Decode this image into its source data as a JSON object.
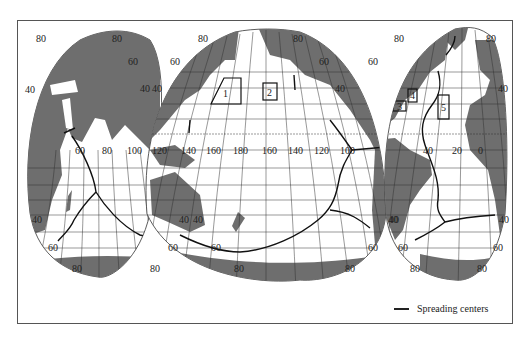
{
  "map": {
    "projection": "interrupted (three-lobe) world map",
    "colors": {
      "land": "#6e6e6e",
      "ocean": "#ffffff",
      "grid": "#333333",
      "ridge": "#111111",
      "frame": "#555555"
    },
    "lobes": [
      {
        "name": "Indian Ocean / Africa-Eurasia lobe",
        "lat_labels_top": [
          "80",
          "80",
          "60",
          "40",
          "40"
        ],
        "lat_labels_bottom": [
          "40",
          "40",
          "60",
          "60",
          "80",
          "80"
        ],
        "lon_labels": [
          "60",
          "80",
          "100",
          "120"
        ]
      },
      {
        "name": "Pacific lobe",
        "lat_labels_top": [
          "80",
          "80",
          "60",
          "60",
          "40",
          "40"
        ],
        "lat_labels_bottom": [
          "40",
          "40",
          "60",
          "60",
          "80",
          "80"
        ],
        "lon_labels": [
          "140",
          "160",
          "180",
          "160",
          "140",
          "120",
          "100"
        ]
      },
      {
        "name": "Atlantic lobe",
        "lat_labels_top": [
          "80",
          "80",
          "60",
          "40"
        ],
        "lat_labels_bottom": [
          "40",
          "40",
          "60",
          "60",
          "80",
          "80"
        ],
        "lon_labels": [
          "40",
          "20",
          "0"
        ]
      }
    ],
    "study_areas": [
      {
        "id": "1",
        "label": "1",
        "lobe": "Pacific"
      },
      {
        "id": "2",
        "label": "2",
        "lobe": "Pacific"
      },
      {
        "id": "3",
        "label": "3",
        "lobe": "Atlantic"
      },
      {
        "id": "4",
        "label": "4",
        "lobe": "Atlantic"
      },
      {
        "id": "5",
        "label": "5",
        "lobe": "Atlantic"
      }
    ]
  },
  "labels": {
    "l1_80a": "80",
    "l1_80b": "80",
    "l1_60": "60",
    "l1_40a": "40",
    "l1_40b": "40",
    "l1_60lon": "60",
    "l1_80lon": "80",
    "l1_100lon": "100",
    "l1_120lon": "120",
    "l1_40c": "40",
    "l1_40d": "40",
    "l1_60c": "60",
    "l1_60d": "60",
    "l1_80c": "80",
    "l1_80d": "80",
    "l2_80a": "80",
    "l2_80b": "80",
    "l2_60a": "60",
    "l2_60b": "60",
    "l2_40a": "40",
    "l2_40b": "40",
    "l2_140": "140",
    "l2_160": "160",
    "l2_180": "180",
    "l2_160b": "160",
    "l2_140b": "140",
    "l2_120b": "120",
    "l2_100b": "100",
    "l2_40c": "40",
    "l2_40d": "40",
    "l2_60c": "60",
    "l2_60d": "60",
    "l2_80c": "80",
    "l2_80d": "80",
    "l3_80a": "80",
    "l3_80b": "80",
    "l3_60a": "60",
    "l3_40a": "40",
    "l3_40lon": "40",
    "l3_20lon": "20",
    "l3_0lon": "0",
    "l3_40c": "40",
    "l3_40d": "40",
    "l3_60c": "60",
    "l3_60d": "60",
    "l3_80c": "80",
    "l3_80d": "80"
  },
  "legend": {
    "label": "Spreading centers"
  }
}
